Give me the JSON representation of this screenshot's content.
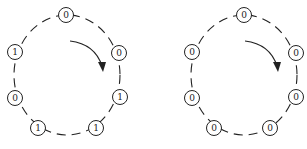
{
  "diagram": {
    "type": "ring-diagram",
    "colors": {
      "stroke": "#222222",
      "background": "#ffffff"
    },
    "rings": [
      {
        "id": "left",
        "direction": "clockwise",
        "nodes": [
          {
            "pos": "top",
            "value": "0",
            "x": 66,
            "y": 15
          },
          {
            "pos": "upper-right",
            "value": "0",
            "x": 119,
            "y": 53
          },
          {
            "pos": "lower-right",
            "value": "1",
            "x": 120,
            "y": 97
          },
          {
            "pos": "bottom-right",
            "value": "1",
            "x": 96,
            "y": 128
          },
          {
            "pos": "bottom-left",
            "value": "1",
            "x": 38,
            "y": 128
          },
          {
            "pos": "lower-left",
            "value": "0",
            "x": 15,
            "y": 98
          },
          {
            "pos": "upper-left",
            "value": "1",
            "x": 15,
            "y": 52
          }
        ]
      },
      {
        "id": "right",
        "direction": "clockwise",
        "nodes": [
          {
            "pos": "top",
            "value": "0",
            "x": 244,
            "y": 15
          },
          {
            "pos": "upper-right",
            "value": "0",
            "x": 296,
            "y": 53
          },
          {
            "pos": "lower-right",
            "value": "0",
            "x": 296,
            "y": 97
          },
          {
            "pos": "bottom-right",
            "value": "0",
            "x": 270,
            "y": 128
          },
          {
            "pos": "bottom-left",
            "value": "0",
            "x": 214,
            "y": 128
          },
          {
            "pos": "lower-left",
            "value": "0",
            "x": 192,
            "y": 98
          },
          {
            "pos": "upper-left",
            "value": "0",
            "x": 192,
            "y": 52
          }
        ]
      }
    ]
  }
}
